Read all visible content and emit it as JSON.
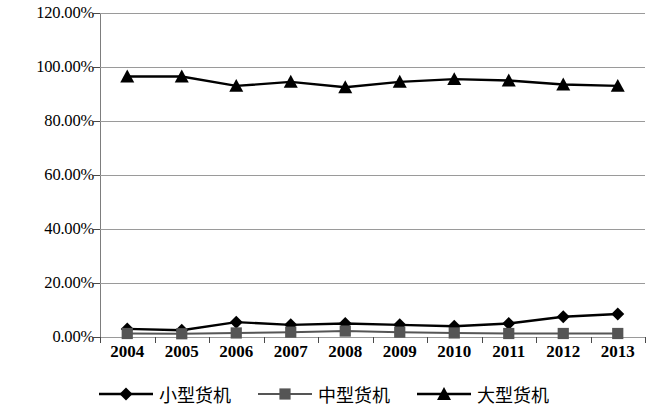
{
  "chart_data": {
    "type": "line",
    "title": "",
    "xlabel": "",
    "ylabel": "",
    "categories": [
      "2004",
      "2005",
      "2006",
      "2007",
      "2008",
      "2009",
      "2010",
      "2011",
      "2012",
      "2013"
    ],
    "ylim": [
      0,
      120
    ],
    "ytick_values": [
      0,
      20,
      40,
      60,
      80,
      100,
      120
    ],
    "ytick_labels": [
      "0.00%",
      "20.00%",
      "40.00%",
      "60.00%",
      "80.00%",
      "100.00%",
      "120.00%"
    ],
    "grid": true,
    "legend_position": "bottom",
    "series": [
      {
        "name": "小型货机",
        "marker": "diamond",
        "color": "#000000",
        "values": [
          3.0,
          2.5,
          5.5,
          4.5,
          5.0,
          4.5,
          4.0,
          5.0,
          7.5,
          8.5
        ]
      },
      {
        "name": "中型货机",
        "marker": "square",
        "color": "#555555",
        "values": [
          1.3,
          1.2,
          1.5,
          1.8,
          2.2,
          1.8,
          1.5,
          1.3,
          1.3,
          1.3
        ]
      },
      {
        "name": "大型货机",
        "marker": "triangle",
        "color": "#000000",
        "values": [
          96.5,
          96.5,
          93.0,
          94.5,
          92.5,
          94.5,
          95.5,
          95.0,
          93.5,
          93.0
        ]
      }
    ]
  },
  "legend": {
    "items": [
      {
        "label": "小型货机",
        "marker": "diamond-marker-icon"
      },
      {
        "label": "中型货机",
        "marker": "square-marker-icon"
      },
      {
        "label": "大型货机",
        "marker": "triangle-marker-icon"
      }
    ]
  }
}
